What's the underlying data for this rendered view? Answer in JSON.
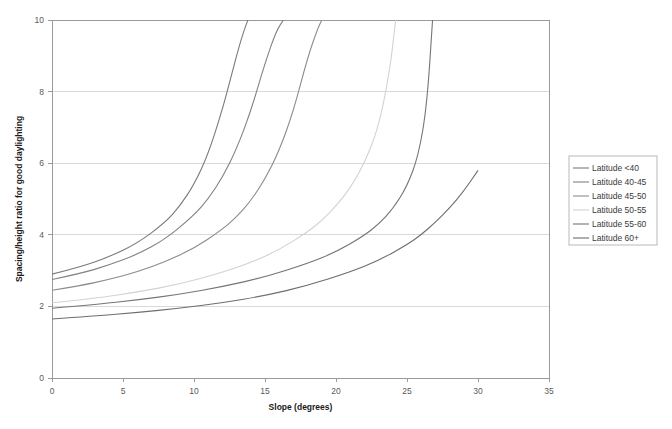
{
  "chart_data": {
    "type": "line",
    "title": "",
    "xlabel": "Slope (degrees)",
    "ylabel": "Spacing/height ratio for good daylighting",
    "xlim": [
      0,
      35
    ],
    "ylim": [
      0,
      10
    ],
    "xticks": [
      "0",
      "5",
      "10",
      "15",
      "20",
      "25",
      "30",
      "35"
    ],
    "yticks": [
      "0",
      "2",
      "4",
      "6",
      "8",
      "10"
    ],
    "grid": "horizontal",
    "legend_position": "right",
    "series": [
      {
        "name": "Latitude <40",
        "color": "#7a7a7a",
        "x": [
          0,
          2,
          4,
          6,
          8,
          9,
          10,
          11,
          12,
          12.6,
          13.2,
          13.6,
          13.8
        ],
        "y": [
          2.9,
          3.1,
          3.38,
          3.76,
          4.35,
          4.8,
          5.4,
          6.25,
          7.5,
          8.4,
          9.3,
          9.8,
          10.0
        ]
      },
      {
        "name": "Latitude 40-45",
        "color": "#828282",
        "x": [
          0,
          2,
          4,
          6,
          8,
          10,
          11,
          12,
          13,
          14,
          15,
          15.8,
          16.3
        ],
        "y": [
          2.75,
          2.92,
          3.15,
          3.45,
          3.88,
          4.55,
          5.0,
          5.6,
          6.4,
          7.45,
          8.8,
          9.7,
          10.0
        ]
      },
      {
        "name": "Latitude 45-50",
        "color": "#8c8c8c",
        "x": [
          0,
          2,
          4,
          6,
          8,
          10,
          12,
          13,
          14,
          15,
          16,
          17,
          18,
          18.7,
          19.0
        ],
        "y": [
          2.45,
          2.58,
          2.75,
          2.96,
          3.25,
          3.62,
          4.15,
          4.5,
          4.95,
          5.55,
          6.35,
          7.45,
          8.95,
          9.75,
          10.0
        ]
      },
      {
        "name": "Latitude 50-55",
        "color": "#d2d2d2",
        "x": [
          0,
          3,
          6,
          9,
          12,
          14,
          16,
          18,
          19,
          20,
          21,
          22,
          23,
          23.8,
          24.2
        ],
        "y": [
          2.1,
          2.22,
          2.4,
          2.62,
          2.95,
          3.22,
          3.58,
          4.08,
          4.4,
          4.8,
          5.3,
          6.0,
          7.0,
          8.6,
          10.0
        ]
      },
      {
        "name": "Latitude 55-60",
        "color": "#757575",
        "x": [
          0,
          3,
          6,
          9,
          12,
          15,
          18,
          20,
          22,
          23,
          24,
          25,
          25.8,
          26.4,
          26.8
        ],
        "y": [
          1.95,
          2.05,
          2.18,
          2.34,
          2.55,
          2.82,
          3.2,
          3.52,
          3.98,
          4.3,
          4.72,
          5.35,
          6.2,
          7.6,
          10.0
        ]
      },
      {
        "name": "Latitude 60+",
        "color": "#6e6e6e",
        "x": [
          0,
          3,
          6,
          9,
          12,
          15,
          18,
          21,
          23,
          25,
          26,
          27,
          28,
          29,
          30
        ],
        "y": [
          1.65,
          1.73,
          1.83,
          1.95,
          2.1,
          2.3,
          2.58,
          2.96,
          3.28,
          3.72,
          4.0,
          4.35,
          4.75,
          5.22,
          5.8
        ]
      }
    ]
  }
}
